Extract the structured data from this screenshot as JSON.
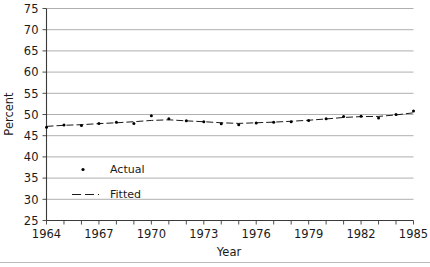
{
  "chart_data": {
    "type": "line",
    "title": "",
    "xlabel": "Year",
    "ylabel": "Percent",
    "xlim": [
      1964,
      1985
    ],
    "ylim": [
      25,
      75
    ],
    "grid": true,
    "legend_position": "inside-lower-left",
    "y_ticks": [
      25,
      30,
      35,
      40,
      45,
      50,
      55,
      60,
      65,
      70,
      75
    ],
    "y_tick_labels": [
      "25",
      "30",
      "35",
      "40",
      "45",
      "50",
      "55",
      "60",
      "65",
      "70",
      "75"
    ],
    "x_ticks": [
      1964,
      1965,
      1966,
      1967,
      1968,
      1969,
      1970,
      1971,
      1972,
      1973,
      1974,
      1975,
      1976,
      1977,
      1978,
      1979,
      1980,
      1981,
      1982,
      1983,
      1984,
      1985
    ],
    "x_tick_labels_shown": [
      "1964",
      "1967",
      "1970",
      "1973",
      "1976",
      "1979",
      "1982",
      "1985"
    ],
    "x": [
      1964,
      1965,
      1966,
      1967,
      1968,
      1969,
      1970,
      1971,
      1972,
      1973,
      1974,
      1975,
      1976,
      1977,
      1978,
      1979,
      1980,
      1981,
      1982,
      1983,
      1984,
      1985
    ],
    "series": [
      {
        "name": "Actual",
        "style": "markers",
        "marker": "dot",
        "color": "#000000",
        "values": [
          47.0,
          47.5,
          47.4,
          47.9,
          48.2,
          47.9,
          49.7,
          49.0,
          48.5,
          48.3,
          47.8,
          47.6,
          48.0,
          48.2,
          48.3,
          48.6,
          49.0,
          49.5,
          49.6,
          49.2,
          50.0,
          50.8
        ]
      },
      {
        "name": "Fitted",
        "style": "line",
        "dash": "dashed",
        "color": "#1a1a1a",
        "values": [
          47.2,
          47.45,
          47.6,
          47.85,
          48.05,
          48.3,
          48.6,
          48.75,
          48.5,
          48.3,
          48.05,
          47.9,
          48.05,
          48.2,
          48.4,
          48.65,
          48.95,
          49.3,
          49.5,
          49.55,
          49.9,
          50.4
        ]
      }
    ],
    "legend": [
      {
        "label": "Actual",
        "marker": "dot"
      },
      {
        "label": "Fitted",
        "marker": "dashed-line"
      }
    ]
  },
  "colors": {
    "grid": "#a6a6a6",
    "axis": "#3a3a3a",
    "data": "#000000",
    "background": "#ffffff"
  }
}
